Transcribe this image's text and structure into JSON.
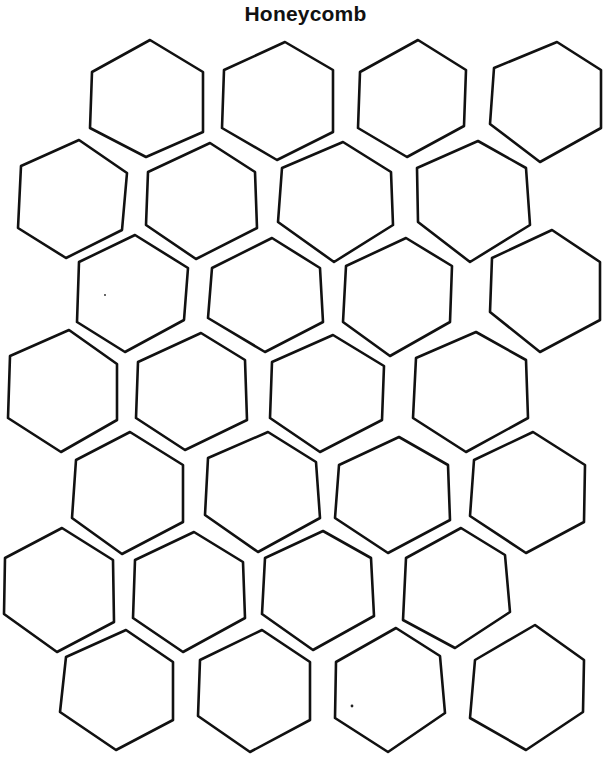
{
  "page": {
    "title": "Honeycomb",
    "colors": {
      "background": "#ffffff",
      "outline": "#111111"
    }
  },
  "honeycomb": {
    "rows": 7,
    "cells_per_row": 4,
    "total_cells": 28,
    "cells": [
      {
        "row": 1,
        "col": 1,
        "points": "92,72 150,40 203,72 203,132 146,157 90,128"
      },
      {
        "row": 1,
        "col": 2,
        "points": "224,70 285,42 333,70 333,132 277,160 222,128"
      },
      {
        "row": 1,
        "col": 3,
        "points": "360,72 418,40 466,70 464,126 407,157 358,128"
      },
      {
        "row": 1,
        "col": 4,
        "points": "494,68 557,42 601,70 601,128 540,162 490,124"
      },
      {
        "row": 2,
        "col": 1,
        "points": "21,166 79,140 127,173 122,230 66,258 18,228"
      },
      {
        "row": 2,
        "col": 2,
        "points": "148,172 210,143 255,172 257,228 196,259 146,225"
      },
      {
        "row": 2,
        "col": 3,
        "points": "282,168 343,142 391,172 393,225 334,262 278,222"
      },
      {
        "row": 2,
        "col": 4,
        "points": "417,168 478,141 526,168 530,225 470,262 418,222"
      },
      {
        "row": 3,
        "col": 1,
        "points": "79,262 135,235 188,268 184,320 125,352 77,322"
      },
      {
        "row": 3,
        "col": 2,
        "points": "212,268 272,238 320,268 323,322 265,352 208,318"
      },
      {
        "row": 3,
        "col": 3,
        "points": "346,266 406,238 452,266 450,322 390,356 343,322"
      },
      {
        "row": 3,
        "col": 4,
        "points": "492,258 552,230 600,262 600,320 540,352 490,312"
      },
      {
        "row": 4,
        "col": 1,
        "points": "10,356 69,330 117,364 117,420 61,452 8,418"
      },
      {
        "row": 4,
        "col": 2,
        "points": "138,362 201,333 245,360 247,420 185,450 136,418"
      },
      {
        "row": 4,
        "col": 3,
        "points": "272,362 333,335 384,366 382,420 320,452 270,418"
      },
      {
        "row": 4,
        "col": 4,
        "points": "416,358 476,332 526,360 528,418 466,452 413,418"
      },
      {
        "row": 5,
        "col": 1,
        "points": "76,460 130,432 183,465 183,522 122,554 72,518"
      },
      {
        "row": 5,
        "col": 2,
        "points": "208,458 268,432 316,462 320,518 258,552 205,515"
      },
      {
        "row": 5,
        "col": 3,
        "points": "339,465 399,437 448,465 450,520 388,553 335,518"
      },
      {
        "row": 5,
        "col": 4,
        "points": "474,460 533,432 585,465 584,522 526,553 470,516"
      },
      {
        "row": 6,
        "col": 1,
        "points": "5,558 62,528 113,560 114,622 57,652 4,614"
      },
      {
        "row": 6,
        "col": 2,
        "points": "135,560 194,532 243,562 245,618 183,652 133,618"
      },
      {
        "row": 6,
        "col": 3,
        "points": "265,558 323,531 371,558 374,616 313,650 262,614"
      },
      {
        "row": 6,
        "col": 4,
        "points": "406,558 461,528 505,555 510,612 455,648 403,620"
      },
      {
        "row": 7,
        "col": 1,
        "points": "66,657 126,630 173,662 173,720 116,750 60,712"
      },
      {
        "row": 7,
        "col": 2,
        "points": "200,660 262,630 310,662 310,720 250,752 198,716"
      },
      {
        "row": 7,
        "col": 3,
        "points": "336,662 396,628 440,656 445,713 388,752 335,718"
      },
      {
        "row": 7,
        "col": 4,
        "points": "475,660 535,625 584,660 583,712 526,750 470,718"
      }
    ],
    "specks": [
      {
        "cx": 105,
        "cy": 295,
        "r": 0.9
      },
      {
        "cx": 352,
        "cy": 706,
        "r": 1.4
      }
    ]
  }
}
